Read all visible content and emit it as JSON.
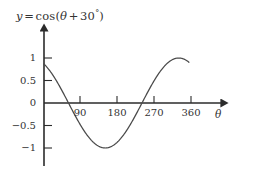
{
  "title": {
    "lhs": "y",
    "equals": "=",
    "fn": "cos",
    "open": "(",
    "theta": "θ",
    "plus": "+",
    "amplitude": "30",
    "degree": "°",
    "close": ")",
    "full": "y = cos(θ + 30°)"
  },
  "axes": {
    "x_name": "θ",
    "y_name": "y"
  },
  "chart_data": {
    "type": "line",
    "xlabel": "θ",
    "ylabel": "y",
    "function": "y = cos(theta + 30)",
    "phase_shift_degrees": -30,
    "amplitude": 1,
    "period_degrees": 360,
    "grid": false,
    "legend": false,
    "xlim": [
      0,
      390
    ],
    "ylim": [
      -1.35,
      1.35
    ],
    "xticks": [
      90,
      180,
      270,
      360
    ],
    "xtick_labels": [
      "90",
      "180",
      "270",
      "360"
    ],
    "yticks": [
      1,
      0.5,
      0,
      -0.5,
      -1
    ],
    "ytick_labels": [
      "1",
      "0.5",
      "0",
      "−0.5",
      "−1"
    ],
    "x_start": 0,
    "x_end": 355,
    "key_points": [
      {
        "x": 0,
        "y": 0.866,
        "note": "start value"
      },
      {
        "x": 60,
        "y": 0,
        "note": "descending zero crossing"
      },
      {
        "x": 150,
        "y": -1,
        "note": "minimum"
      },
      {
        "x": 240,
        "y": 0,
        "note": "ascending zero crossing"
      },
      {
        "x": 330,
        "y": 1,
        "note": "maximum"
      },
      {
        "x": 355,
        "y": 0.85,
        "note": "end of drawn curve"
      }
    ],
    "x": [
      0,
      10,
      20,
      30,
      40,
      50,
      60,
      70,
      80,
      90,
      100,
      110,
      120,
      130,
      140,
      150,
      160,
      170,
      180,
      190,
      200,
      210,
      220,
      230,
      240,
      250,
      260,
      270,
      280,
      290,
      300,
      310,
      320,
      330,
      340,
      350,
      355
    ],
    "values": [
      0.866,
      0.766,
      0.643,
      0.5,
      0.342,
      0.174,
      0.0,
      -0.174,
      -0.342,
      -0.5,
      -0.643,
      -0.766,
      -0.866,
      -0.94,
      -0.985,
      -1.0,
      -0.985,
      -0.94,
      -0.866,
      -0.766,
      -0.643,
      -0.5,
      -0.342,
      -0.174,
      0.0,
      0.174,
      0.342,
      0.5,
      0.643,
      0.766,
      0.866,
      0.94,
      0.985,
      1.0,
      0.985,
      0.94,
      0.906
    ]
  },
  "colors": {
    "curve": "#4a4a4a",
    "axis": "#2b2b2b",
    "text": "#333333",
    "background": "#ffffff"
  }
}
